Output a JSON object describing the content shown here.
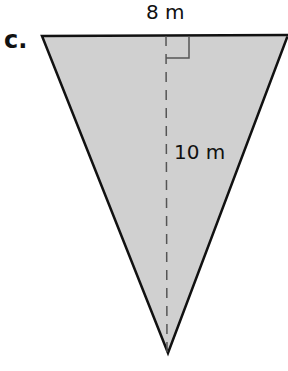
{
  "problem": {
    "part_label": "c.",
    "base_label": "8 m",
    "height_label": "10 m",
    "shape": "inverted-triangle",
    "fill_color": "#d0d0d0",
    "stroke_color": "#111111",
    "height_line_color": "#555555"
  }
}
